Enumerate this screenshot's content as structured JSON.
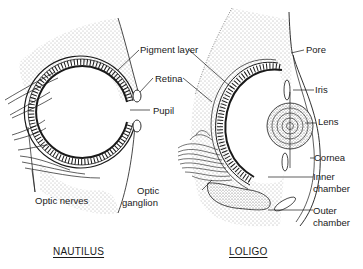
{
  "figure": {
    "panels": [
      {
        "id": "nautilus",
        "title": "NAUTILUS",
        "labels": {
          "pigment_layer": "Pigment layer",
          "retina": "Retina",
          "pupil": "Pupil",
          "optic_nerves": "Optic nerves"
        }
      },
      {
        "id": "loligo",
        "title": "LOLIGO",
        "labels": {
          "pore": "Pore",
          "iris": "Iris",
          "lens": "Lens",
          "cornea": "Cornea",
          "inner_chamber_1": "Inner",
          "inner_chamber_2": "chamber",
          "outer_chamber_1": "Outer",
          "outer_chamber_2": "chamber",
          "optic_ganglion_1": "Optic",
          "optic_ganglion_2": "ganglion"
        }
      }
    ],
    "colors": {
      "ink": "#1a1a1a",
      "background": "#ffffff",
      "stipple": "#555555"
    }
  }
}
